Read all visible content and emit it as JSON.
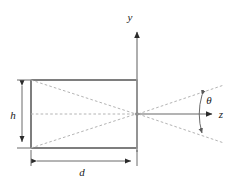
{
  "figure": {
    "type": "geometry-diagram",
    "title": "",
    "background_color": "#ffffff",
    "stroke_color": "#3a3a3a",
    "dashed_color": "#b0b0b0",
    "axis_color": "#888888",
    "label_color": "#1a1a1a"
  },
  "axes": {
    "y_axis": {
      "label": "y",
      "label_x": 132,
      "label_y": 20,
      "line_x": 137,
      "line_top": 28,
      "line_bottom": 152,
      "arrow": "up"
    },
    "z_axis": {
      "label": "z",
      "label_x": 222,
      "label_y": 117,
      "line_y": 114,
      "line_left": 137,
      "line_right": 216,
      "arrow": "right"
    },
    "origin": {
      "x": 137,
      "y": 114
    }
  },
  "rectangle": {
    "name": "detector-plane",
    "left": 31,
    "top": 80,
    "right": 137,
    "bottom": 148,
    "width": 106,
    "height": 68
  },
  "rays": {
    "description": "dashed cone lines from rectangle corners converging at origin and diverging to the right",
    "left_cone": [
      {
        "from_x": 31,
        "from_y": 80,
        "to_x": 137,
        "to_y": 114
      },
      {
        "from_x": 31,
        "from_y": 114,
        "to_x": 137,
        "to_y": 114
      },
      {
        "from_x": 31,
        "from_y": 148,
        "to_x": 137,
        "to_y": 114
      }
    ],
    "right_cone": [
      {
        "from_x": 137,
        "from_y": 114,
        "to_x": 224,
        "to_y": 85
      },
      {
        "from_x": 137,
        "from_y": 114,
        "to_x": 224,
        "to_y": 143
      }
    ]
  },
  "dimensions": {
    "height": {
      "label": "h",
      "label_x": 12,
      "label_y": 118,
      "line_x": 22,
      "top": 80,
      "bottom": 148
    },
    "depth": {
      "label": "d",
      "label_x": 81,
      "label_y": 175,
      "line_y": 161,
      "left": 31,
      "right": 137
    }
  },
  "angle": {
    "label": "θ",
    "label_x": 206,
    "label_y": 103,
    "arc_x": 202,
    "arc_top_y": 93,
    "arc_bottom_y": 135,
    "description": "half-angle theta measured from z-axis between the two diverging dashed rays"
  }
}
